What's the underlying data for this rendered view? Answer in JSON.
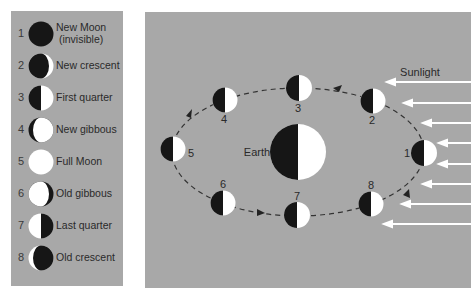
{
  "colors": {
    "panel_bg": "#a8a8a8",
    "moon_dark": "#161616",
    "moon_light": "#ffffff",
    "orbit": "#333333",
    "sunlight_arrow": "#ffffff",
    "text": "#2a2a2a"
  },
  "legend": {
    "items": [
      {
        "number": "1",
        "phase": "new-moon",
        "label": "New Moon",
        "label2": "(invisible)"
      },
      {
        "number": "2",
        "phase": "new-crescent",
        "label": "New crescent"
      },
      {
        "number": "3",
        "phase": "first-quarter",
        "label": "First quarter"
      },
      {
        "number": "4",
        "phase": "new-gibbous",
        "label": "New gibbous"
      },
      {
        "number": "5",
        "phase": "full-moon",
        "label": "Full Moon"
      },
      {
        "number": "6",
        "phase": "old-gibbous",
        "label": "Old gibbous"
      },
      {
        "number": "7",
        "phase": "last-quarter",
        "label": "Last quarter"
      },
      {
        "number": "8",
        "phase": "old-crescent",
        "label": "Old crescent"
      }
    ]
  },
  "diagram": {
    "earth_label": "Earth",
    "sunlight_label": "Sunlight",
    "orbit_positions": [
      {
        "number": "1",
        "x": 279,
        "y": 141
      },
      {
        "number": "2",
        "x": 228,
        "y": 89
      },
      {
        "number": "3",
        "x": 154,
        "y": 76
      },
      {
        "number": "4",
        "x": 80,
        "y": 88
      },
      {
        "number": "5",
        "x": 28,
        "y": 137
      },
      {
        "number": "6",
        "x": 78,
        "y": 191
      },
      {
        "number": "7",
        "x": 152,
        "y": 203
      },
      {
        "number": "8",
        "x": 226,
        "y": 192
      }
    ],
    "sunlight_arrows_count": 8
  }
}
